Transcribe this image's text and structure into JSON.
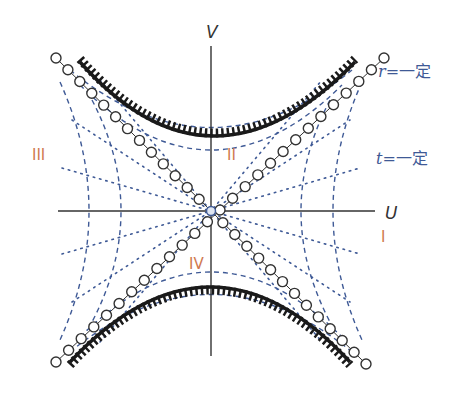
{
  "diagram": {
    "axes": {
      "vertical_label": "V",
      "horizontal_label": "U"
    },
    "regions": [
      {
        "id": "I",
        "label": "I"
      },
      {
        "id": "II",
        "label": "II"
      },
      {
        "id": "III",
        "label": "III"
      },
      {
        "id": "IV",
        "label": "IV"
      }
    ],
    "legend": {
      "r_const": {
        "var": "r",
        "text": "=一定"
      },
      "t_const": {
        "var": "t",
        "text": "=一定"
      }
    },
    "colors": {
      "axis": "#333333",
      "singularity": "#1a1a1a",
      "horizon_circles": "#333333",
      "r_const_lines": "#3f5a96",
      "t_const_lines": "#3f5a96",
      "region_labels": "#d0794f"
    }
  }
}
